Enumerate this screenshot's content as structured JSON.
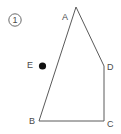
{
  "figure": {
    "problem_number": "1",
    "problem_number_display": "①",
    "marker_style": "circled-number",
    "shape_name": "quadrilateral-ABCD",
    "background_color": "#ffffff",
    "stroke_color": "#5a5a5a",
    "label_color": "#4a4a4a",
    "dot_color": "#111111",
    "vertices": [
      {
        "id": "A",
        "label": "A",
        "x": 76,
        "y": 7
      },
      {
        "id": "B",
        "label": "B",
        "x": 39,
        "y": 121
      },
      {
        "id": "C",
        "label": "C",
        "x": 104,
        "y": 121
      },
      {
        "id": "D",
        "label": "D",
        "x": 104,
        "y": 66
      }
    ],
    "interior_points": [
      {
        "id": "E",
        "label": "E",
        "x": 42.5,
        "y": 66,
        "radius": 3.5,
        "filled": true
      }
    ],
    "edges": [
      {
        "from": "A",
        "to": "D"
      },
      {
        "from": "D",
        "to": "C"
      },
      {
        "from": "C",
        "to": "B"
      },
      {
        "from": "B",
        "to": "A"
      }
    ],
    "labels": {
      "A": "A",
      "B": "B",
      "C": "C",
      "D": "D",
      "E": "E"
    }
  }
}
